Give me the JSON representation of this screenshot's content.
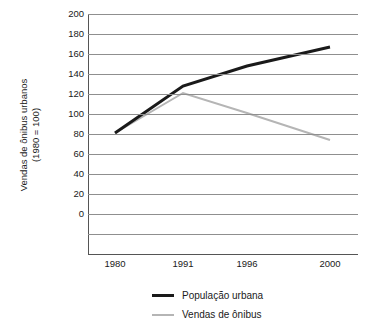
{
  "chart_data": {
    "type": "line",
    "title": "",
    "xlabel": "",
    "ylabel": "Vendas de ônibus urbanos",
    "ylabel_line2": "(1980 = 100)",
    "categories": [
      "1980",
      "1991",
      "1996",
      "2000"
    ],
    "x_tick_labels": [
      "1980",
      "1991",
      "1996",
      "2000"
    ],
    "y_tick_labels": [
      "200",
      "180",
      "160",
      "140",
      "120",
      "100",
      "80",
      "60",
      "40",
      "20",
      "0"
    ],
    "ylim": [
      -40,
      200
    ],
    "y_axis_min_labeled": 0,
    "y_axis_max_labeled": 200,
    "y_tick_step": 20,
    "grid": true,
    "grid_below_zero_lines": 2,
    "legend_position": "bottom",
    "series": [
      {
        "name": "População urbana",
        "color": "#1a1a1a",
        "width": 3,
        "values": [
          81,
          128,
          148,
          167
        ]
      },
      {
        "name": "Vendas de ônibus",
        "color": "#b5b5b5",
        "width": 2,
        "values": [
          81,
          121,
          101,
          74
        ]
      }
    ]
  },
  "axes": {
    "y_ticks": [
      {
        "label": "200",
        "value": 200
      },
      {
        "label": "180",
        "value": 180
      },
      {
        "label": "160",
        "value": 160
      },
      {
        "label": "140",
        "value": 140
      },
      {
        "label": "120",
        "value": 120
      },
      {
        "label": "100",
        "value": 100
      },
      {
        "label": "80",
        "value": 80
      },
      {
        "label": "60",
        "value": 60
      },
      {
        "label": "40",
        "value": 40
      },
      {
        "label": "20",
        "value": 20
      },
      {
        "label": "0",
        "value": 0
      }
    ],
    "x_ticks": [
      {
        "label": "1980",
        "value": 1980
      },
      {
        "label": "1991",
        "value": 1991
      },
      {
        "label": "1996",
        "value": 1996
      },
      {
        "label": "2000",
        "value": 2000
      }
    ],
    "y_axis_title": "Vendas de ônibus urbanos",
    "y_axis_subtitle": "(1980 = 100)"
  },
  "legend": {
    "items": [
      {
        "label": "População urbana",
        "color": "#1a1a1a",
        "style": "thick"
      },
      {
        "label": "Vendas de ônibus",
        "color": "#b5b5b5",
        "style": "thin"
      }
    ]
  },
  "colors": {
    "series_urban_population": "#1a1a1a",
    "series_bus_sales": "#b5b5b5",
    "gridline": "#8f8f8f",
    "axis": "#555555",
    "background": "#ffffff",
    "text": "#1a1a1a"
  }
}
